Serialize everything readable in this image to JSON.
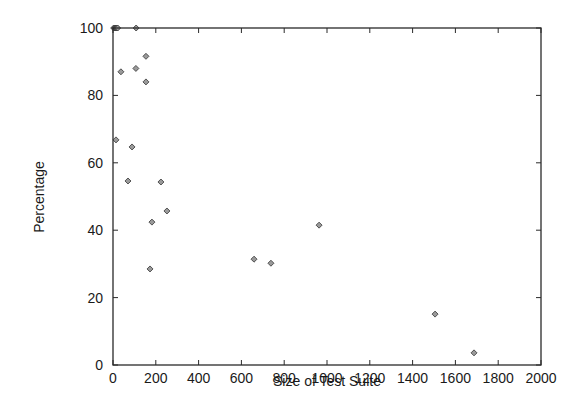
{
  "chart_data": {
    "type": "scatter",
    "title": "",
    "xlabel": "Size of Test Suite",
    "ylabel": "Percentage",
    "xlim": [
      0,
      2000
    ],
    "ylim": [
      0,
      100
    ],
    "xticks": [
      0,
      200,
      400,
      600,
      800,
      1000,
      1200,
      1400,
      1600,
      1800,
      2000
    ],
    "yticks": [
      0,
      20,
      40,
      60,
      80,
      100
    ],
    "grid": false,
    "legend": null,
    "marker": "diamond",
    "series": [
      {
        "name": "points",
        "points": [
          {
            "x": 3,
            "y": 100
          },
          {
            "x": 7,
            "y": 100
          },
          {
            "x": 10,
            "y": 100
          },
          {
            "x": 14,
            "y": 100
          },
          {
            "x": 18,
            "y": 100
          },
          {
            "x": 22,
            "y": 100
          },
          {
            "x": 108,
            "y": 100
          },
          {
            "x": 154,
            "y": 91.6
          },
          {
            "x": 107,
            "y": 88
          },
          {
            "x": 37,
            "y": 87
          },
          {
            "x": 154,
            "y": 84
          },
          {
            "x": 14,
            "y": 66.8
          },
          {
            "x": 89,
            "y": 64.7
          },
          {
            "x": 70,
            "y": 54.6
          },
          {
            "x": 224,
            "y": 54.3
          },
          {
            "x": 252,
            "y": 45.7
          },
          {
            "x": 182,
            "y": 42.4
          },
          {
            "x": 963,
            "y": 41.5
          },
          {
            "x": 659,
            "y": 31.4
          },
          {
            "x": 738,
            "y": 30.2
          },
          {
            "x": 173,
            "y": 28.5
          },
          {
            "x": 1505,
            "y": 15.1
          },
          {
            "x": 1687,
            "y": 3.6
          }
        ]
      }
    ]
  },
  "colors": {
    "axis": "#2a2a2a",
    "marker_fill": "#9a9a9a",
    "marker_stroke": "#333333"
  },
  "layout": {
    "plot_left": 113,
    "plot_right": 541,
    "plot_top": 28,
    "plot_bottom": 365
  }
}
